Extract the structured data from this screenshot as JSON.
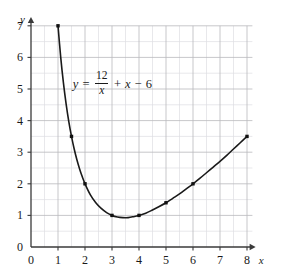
{
  "chart_data": {
    "type": "line",
    "title": "",
    "subtitle": "",
    "equation_text": "y = 12/x + x - 6",
    "equation_parts": {
      "lhs": "y",
      "equals": "=",
      "numerator": "12",
      "denominator": "x",
      "plus": "+",
      "x_term": "x",
      "minus": "−",
      "constant": "6"
    },
    "xlabel": "x",
    "ylabel": "y",
    "xlim": [
      0,
      8.2
    ],
    "ylim": [
      0,
      7.1
    ],
    "xticks": [
      0,
      1,
      2,
      3,
      4,
      5,
      6,
      7,
      8
    ],
    "yticks": [
      0,
      1,
      2,
      3,
      4,
      5,
      6,
      7
    ],
    "xtick_labels": [
      "0",
      "1",
      "2",
      "3",
      "4",
      "5",
      "6",
      "7",
      "8"
    ],
    "ytick_labels": [
      "0",
      "1",
      "2",
      "3",
      "4",
      "5",
      "6",
      "7"
    ],
    "minor_tick_step": 0.5,
    "grid": true,
    "grid_major_color": "#b9b9bd",
    "grid_minor_color": "#dedee2",
    "axis_color": "#3a3a3a",
    "curve_color": "#1a1a1a",
    "marker_color": "#111111",
    "legend": "none",
    "x_domain_plotted": [
      1,
      8
    ],
    "markers": [
      {
        "x": 1,
        "y": 7
      },
      {
        "x": 1.5,
        "y": 3.5
      },
      {
        "x": 2,
        "y": 2
      },
      {
        "x": 3,
        "y": 1
      },
      {
        "x": 4,
        "y": 1
      },
      {
        "x": 5,
        "y": 1.4
      },
      {
        "x": 6,
        "y": 2
      },
      {
        "x": 8,
        "y": 3.5
      }
    ],
    "series": [
      {
        "name": "y = 12/x + x - 6",
        "x": [
          1,
          1.1,
          1.2,
          1.3,
          1.4,
          1.5,
          1.6,
          1.7,
          1.8,
          1.9,
          2,
          2.2,
          2.4,
          2.6,
          2.8,
          3,
          3.2,
          3.4,
          3.6,
          3.8,
          4,
          4.25,
          4.5,
          4.75,
          5,
          5.25,
          5.5,
          5.75,
          6,
          6.25,
          6.5,
          6.75,
          7,
          7.25,
          7.5,
          7.75,
          8
        ],
        "values": [
          7,
          6.01,
          5.2,
          4.53,
          3.97,
          3.5,
          3.1,
          2.76,
          2.47,
          2.22,
          2,
          1.65,
          1.4,
          1.22,
          1.09,
          1,
          0.95,
          0.93,
          0.93,
          0.96,
          1,
          1.07,
          1.17,
          1.28,
          1.4,
          1.54,
          1.68,
          1.84,
          2,
          2.17,
          2.35,
          2.53,
          2.71,
          2.9,
          3.1,
          3.3,
          3.5
        ]
      }
    ]
  }
}
